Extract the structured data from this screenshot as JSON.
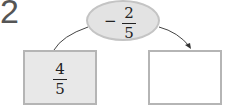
{
  "question_number": "2",
  "operator": {
    "sign": "−",
    "numerator": "2",
    "denominator": "5"
  },
  "start_box": {
    "numerator": "4",
    "denominator": "5"
  },
  "result_box": {
    "value": ""
  },
  "arrow_direction": "left-to-right"
}
